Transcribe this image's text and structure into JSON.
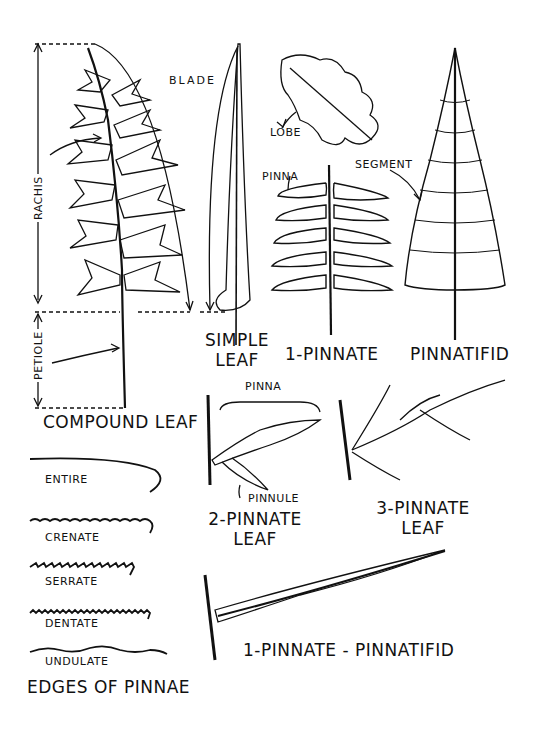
{
  "diagram": {
    "compound_leaf": {
      "title": "COMPOUND LEAF",
      "labels": {
        "rachis": "RACHIS",
        "petiole": "PETIOLE",
        "blade": "BLADE"
      }
    },
    "simple_leaf": {
      "title_line1": "SIMPLE",
      "title_line2": "LEAF"
    },
    "oak_leaf": {
      "label": "LOBE"
    },
    "one_pinnate": {
      "title": "1-PINNATE",
      "label": "PINNA"
    },
    "pinnatifid": {
      "title": "PINNATIFID",
      "label": "SEGMENT"
    },
    "two_pinnate": {
      "title_line1": "2-PINNATE",
      "title_line2": "LEAF",
      "label_top": "PINNA",
      "label_bottom": "PINNULE"
    },
    "three_pinnate": {
      "title_line1": "3-PINNATE",
      "title_line2": "LEAF"
    },
    "one_pinnate_pinnatifid": {
      "title": "1-PINNATE - PINNATIFID"
    },
    "edges": {
      "title": "EDGES OF PINNAE",
      "items": [
        "ENTIRE",
        "CRENATE",
        "SERRATE",
        "DENTATE",
        "UNDULATE"
      ]
    }
  }
}
